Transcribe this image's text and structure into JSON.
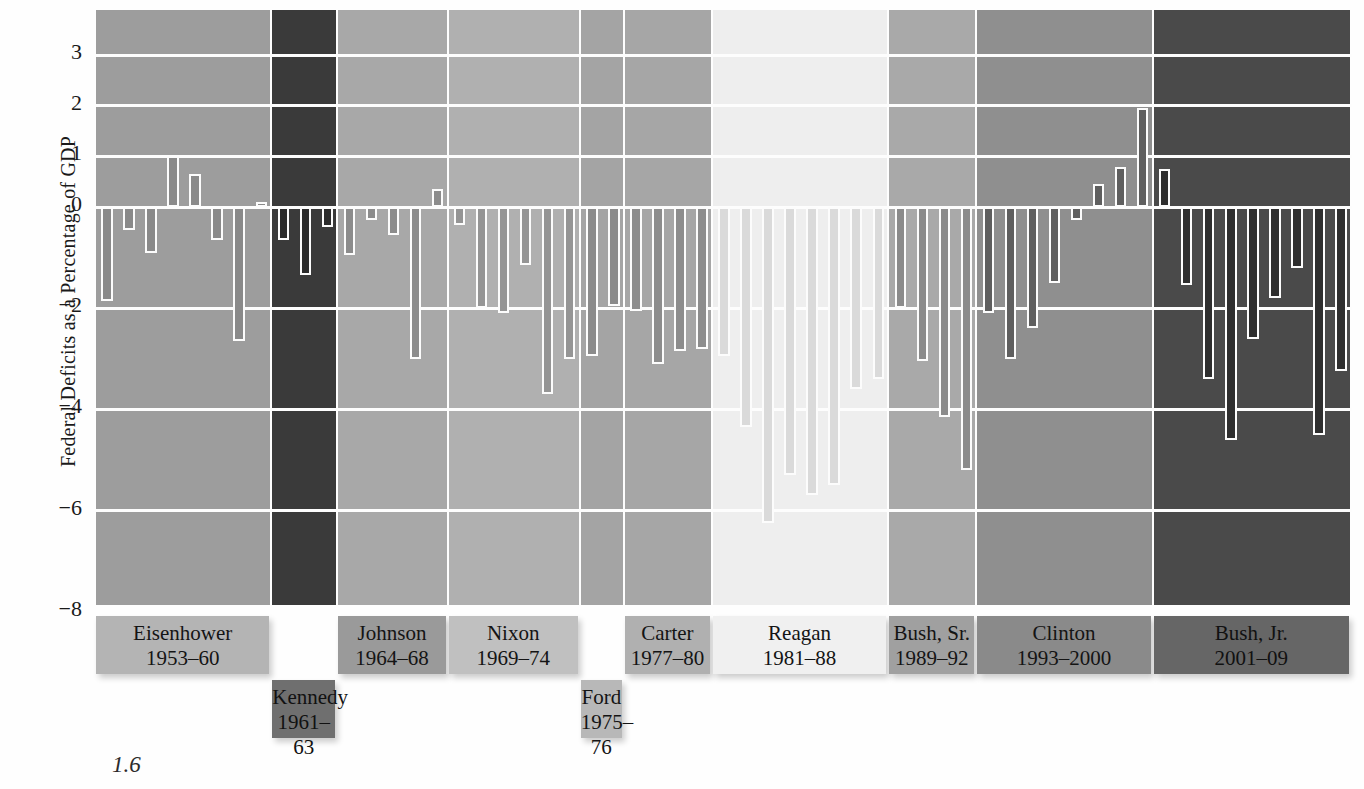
{
  "axis": {
    "ylabel": "Federal Deficits as a Percentage of GDP",
    "ticks": [
      "3",
      "2",
      "1",
      "0",
      "−2",
      "−4",
      "−6",
      "−8"
    ]
  },
  "caption_fragment": "1.6",
  "chart_data": {
    "type": "bar",
    "title": "",
    "xlabel": "",
    "ylabel": "Federal Deficits as a Percentage of GDP",
    "ylim": [
      -8.6,
      3.9
    ],
    "yticks": [
      3,
      2,
      1,
      0,
      -2,
      -4,
      -6,
      -8
    ],
    "grid": true,
    "legend": "none",
    "note": "One bar per fiscal year, grouped into shaded panels by U.S. president. Negative = deficit, positive = surplus.",
    "groups": [
      {
        "name": "Eisenhower",
        "years": "1953–60",
        "panel_color": "#9d9d9d",
        "bar_color": "#8a8a8a",
        "plate_color": "#b4b4b4",
        "x": [
          "1953",
          "1954",
          "1955",
          "1956",
          "1957",
          "1958",
          "1959",
          "1960"
        ],
        "values": [
          -1.85,
          -0.45,
          -0.9,
          1.0,
          0.65,
          -0.65,
          -2.65,
          0.1
        ]
      },
      {
        "name": "Kennedy",
        "years": "1961–63",
        "panel_color": "#3a3a3a",
        "bar_color": "#2b2b2b",
        "plate_color": "#6f6f6f",
        "x": [
          "1961",
          "1962",
          "1963"
        ],
        "values": [
          -0.65,
          -1.35,
          -0.4
        ]
      },
      {
        "name": "Johnson",
        "years": "1964–68",
        "panel_color": "#a8a8a8",
        "bar_color": "#8c8c8c",
        "plate_color": "#9a9a9a",
        "x": [
          "1964",
          "1965",
          "1966",
          "1967",
          "1968"
        ],
        "values": [
          -0.95,
          -0.25,
          -0.55,
          -3.0,
          0.35
        ]
      },
      {
        "name": "Nixon",
        "years": "1969–74",
        "panel_color": "#b0b0b0",
        "bar_color": "#959595",
        "plate_color": "#c0c0c0",
        "x": [
          "1969",
          "1970",
          "1971",
          "1972",
          "1973",
          "1974"
        ],
        "values": [
          -0.35,
          -2.0,
          -2.1,
          -1.15,
          -3.7,
          -3.0
        ]
      },
      {
        "name": "Ford",
        "years": "1975–76",
        "panel_color": "#a4a4a4",
        "bar_color": "#8b8b8b",
        "plate_color": "#b8b8b8",
        "x": [
          "1975",
          "1976"
        ],
        "values": [
          -2.95,
          -1.95
        ]
      },
      {
        "name": "Carter",
        "years": "1977–80",
        "panel_color": "#a6a6a6",
        "bar_color": "#8d8d8d",
        "plate_color": "#b0b0b0",
        "x": [
          "1977",
          "1978",
          "1979",
          "1980"
        ],
        "values": [
          -2.05,
          -3.1,
          -2.85,
          -2.8
        ]
      },
      {
        "name": "Reagan",
        "years": "1981–88",
        "panel_color": "#eeeeee",
        "bar_color": "#dadada",
        "plate_color": "#f0f0f0",
        "x": [
          "1981",
          "1982",
          "1983",
          "1984",
          "1985",
          "1986",
          "1987",
          "1988"
        ],
        "values": [
          -2.95,
          -4.35,
          -6.25,
          -5.3,
          -5.7,
          -5.5,
          -3.6,
          -3.4
        ]
      },
      {
        "name": "Bush, Sr.",
        "years": "1989–92",
        "panel_color": "#a9a9a9",
        "bar_color": "#8b8b8b",
        "plate_color": "#a0a0a0",
        "x": [
          "1989",
          "1990",
          "1991",
          "1992"
        ],
        "values": [
          -2.0,
          -3.05,
          -4.15,
          -5.2
        ]
      },
      {
        "name": "Clinton",
        "years": "1993–2000",
        "panel_color": "#8f8f8f",
        "bar_color": "#5f5f5f",
        "plate_color": "#8a8a8a",
        "x": [
          "1993",
          "1994",
          "1995",
          "1996",
          "1997",
          "1998",
          "1999",
          "2000"
        ],
        "values": [
          -2.1,
          -3.0,
          -2.4,
          -1.5,
          -0.25,
          0.45,
          0.8,
          1.95
        ]
      },
      {
        "name": "Bush, Jr.",
        "years": "2001–09",
        "panel_color": "#4a4a4a",
        "bar_color": "#2e2e2e",
        "plate_color": "#666666",
        "x": [
          "2001",
          "2002",
          "2003",
          "2004",
          "2005",
          "2006",
          "2007",
          "2008",
          "2009"
        ],
        "values": [
          0.75,
          -1.55,
          -3.4,
          -4.6,
          -2.6,
          -1.8,
          -1.2,
          -4.5,
          -3.25
        ]
      }
    ]
  }
}
